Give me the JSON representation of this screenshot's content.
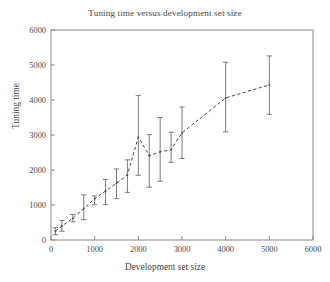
{
  "chart_data": {
    "type": "line",
    "title": "Tuning time versus development set size",
    "xlabel": "Development set size",
    "ylabel": "Tuning time",
    "xlim": [
      0,
      6000
    ],
    "ylim": [
      0,
      6000
    ],
    "xticks": [
      0,
      1000,
      2000,
      3000,
      4000,
      5000,
      6000
    ],
    "yticks": [
      0,
      1000,
      2000,
      3000,
      4000,
      5000,
      6000
    ],
    "xtick_labels": [
      "0",
      "1000",
      "2000",
      "3000",
      "4000",
      "5000",
      "6000"
    ],
    "ytick_labels": [
      "0",
      "1000",
      "2000",
      "3000",
      "4000",
      "5000",
      "6000"
    ],
    "grid": false,
    "legend": null,
    "line_style": "dashed",
    "marker": "point",
    "error_bars": "vertical-capped",
    "x": [
      100,
      250,
      500,
      750,
      1000,
      1250,
      1500,
      1750,
      2000,
      2250,
      2500,
      2750,
      3000,
      4000,
      5000
    ],
    "values": [
      250,
      400,
      620,
      900,
      1180,
      1400,
      1620,
      1860,
      2940,
      2410,
      2520,
      2580,
      3060,
      4060,
      4430
    ],
    "err_low": [
      150,
      250,
      520,
      580,
      1010,
      1010,
      1180,
      1360,
      1850,
      1510,
      1680,
      2220,
      2330,
      3090,
      3590
    ],
    "err_high": [
      350,
      560,
      730,
      1290,
      1260,
      1730,
      2030,
      2290,
      4130,
      3010,
      3500,
      3080,
      3800,
      5080,
      5260
    ],
    "series": [
      {
        "name": "Tuning time",
        "values": [
          250,
          400,
          620,
          900,
          1180,
          1400,
          1620,
          1860,
          2940,
          2410,
          2520,
          2580,
          3060,
          4060,
          4430
        ]
      }
    ]
  },
  "style": {
    "axis_color": "#8a8a8a",
    "line_color": "#4a4a4a",
    "error_color": "#6e6e6e",
    "text_color": "#4a4a4a",
    "background": "#ffffff"
  },
  "geometry": {
    "plot_left": 51,
    "plot_right": 313,
    "plot_top": 30,
    "plot_bottom": 240
  }
}
